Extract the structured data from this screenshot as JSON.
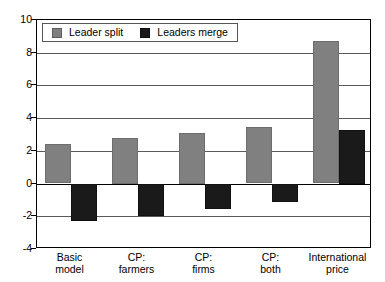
{
  "chart_data": {
    "type": "bar",
    "title": "",
    "xlabel": "",
    "ylabel": "",
    "ylim": [
      -4,
      10
    ],
    "yticks": [
      10,
      8,
      6,
      4,
      2,
      0,
      -2,
      -4
    ],
    "grid": true,
    "legend_position": "top-left",
    "categories": [
      "Basic\nmodel",
      "CP:\nfarmers",
      "CP:\nfirms",
      "CP:\nboth",
      "International\nprice"
    ],
    "series": [
      {
        "name": "Leader split",
        "color": "#808080",
        "values": [
          2.4,
          2.8,
          3.1,
          3.45,
          8.7
        ]
      },
      {
        "name": "Leaders merge",
        "color": "#1a1a1a",
        "values": [
          -2.25,
          -1.95,
          -1.55,
          -1.1,
          3.3
        ]
      }
    ]
  },
  "legend": {
    "items": [
      {
        "label": "Leader split",
        "swatch": "split"
      },
      {
        "label": "Leaders merge",
        "swatch": "merge"
      }
    ]
  },
  "axis": {
    "y_labels": [
      "10",
      "8",
      "6",
      "4",
      "2",
      "0",
      "-2",
      "-4"
    ]
  }
}
